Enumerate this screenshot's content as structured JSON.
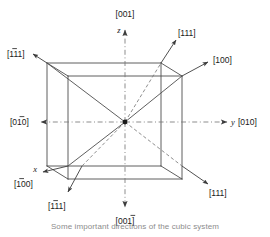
{
  "figure": {
    "caption": "Some important directions of the cubic system",
    "colors": {
      "line": "#4d4d4d",
      "dashed": "#7a7a7a",
      "arrow": "#3c3c3c",
      "text": "#1a1a1a",
      "background": "#ffffff"
    }
  },
  "axes": [
    {
      "id": "z-axis",
      "symbol": "z",
      "label": "[001]",
      "bar": false,
      "position": "top"
    },
    {
      "id": "minus-z-axis",
      "symbol": "",
      "label": "[001]",
      "bar": true,
      "position": "bottom"
    },
    {
      "id": "y-axis",
      "symbol": "y",
      "label": "[010]",
      "bar": false,
      "position": "right"
    },
    {
      "id": "minus-y-axis",
      "symbol": "",
      "label": "[010]",
      "bar": true,
      "position": "left"
    },
    {
      "id": "x-axis",
      "symbol": "x",
      "label": "[100]",
      "bar": true,
      "position": "lower-left"
    },
    {
      "id": "minus-x-axis",
      "symbol": "",
      "label": "[100]",
      "bar": false,
      "position": "upper-right"
    }
  ],
  "diagonals": [
    {
      "id": "diag-upper-left",
      "label": "[111]",
      "bar": true,
      "position": "upper-left"
    },
    {
      "id": "diag-upper-right",
      "label": "[111]",
      "bar": false,
      "position": "upper-right"
    },
    {
      "id": "diag-lower-left",
      "label": "[111]",
      "bar": true,
      "position": "lower-left"
    },
    {
      "id": "diag-lower-right",
      "label": "[111]",
      "bar": false,
      "position": "lower-right"
    }
  ],
  "labels": {
    "top_001": "[001]",
    "top_z": "z",
    "bottom_001": "[001]",
    "left_010": "[010]",
    "right_y": "y",
    "right_010": "[010]",
    "upper_right_100": "[100]",
    "lower_left_x": "x",
    "lower_left_100": "[100]",
    "upper_left_111": "[111]",
    "upper_right_111": "[111]",
    "lower_left_111": "[111]",
    "lower_right_111": "[111]"
  }
}
